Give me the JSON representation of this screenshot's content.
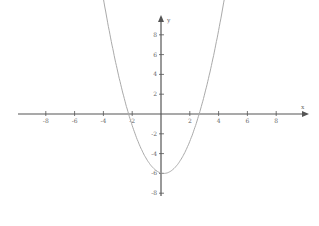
{
  "chart_data": {
    "type": "line",
    "title": "",
    "xlabel": "x",
    "ylabel": "y",
    "xlim": [
      -10,
      10
    ],
    "ylim": [
      -10,
      10
    ],
    "x_ticks": [
      -8,
      -6,
      -4,
      -2,
      2,
      4,
      6,
      8
    ],
    "y_ticks": [
      8,
      6,
      4,
      2,
      -2,
      -4,
      -6,
      -8
    ],
    "grid": false,
    "series": [
      {
        "name": "parabola",
        "equation": "y = (x - 0.2)^2 - 6",
        "vertex": [
          0.2,
          -6
        ],
        "roots": [
          -2.25,
          2.65
        ],
        "color": "#aaaaaa"
      }
    ]
  },
  "axis": {
    "x_label": "x",
    "y_label": "y"
  },
  "colors": {
    "axis": "#555555",
    "curve": "#aaaaaa"
  }
}
